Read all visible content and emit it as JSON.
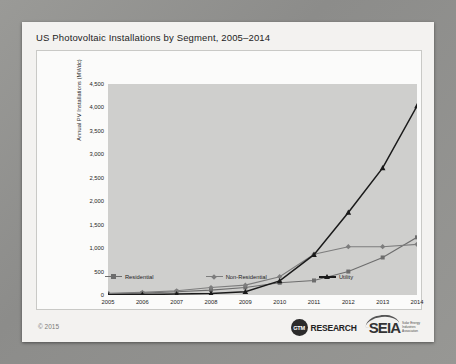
{
  "slide": {
    "title": "US Photovoltaic Installations by Segment, 2005–2014",
    "copyright": "© 2015"
  },
  "footer": {
    "gtm_mark": "GTM",
    "gtm_word": "RESEARCH",
    "seia_word": "SEIA",
    "seia_sub": "Solar Energy\nIndustries\nAssociation"
  },
  "chart_data": {
    "type": "line",
    "title": "US Photovoltaic Installations by Segment, 2005–2014",
    "xlabel": "",
    "ylabel": "Annual PV Installations (MWdc)",
    "categories": [
      "2005",
      "2006",
      "2007",
      "2008",
      "2009",
      "2010",
      "2011",
      "2012",
      "2013",
      "2014"
    ],
    "ylim": [
      0,
      4500
    ],
    "yticks": [
      0,
      500,
      1000,
      1500,
      2000,
      2500,
      3000,
      3500,
      4000,
      4500
    ],
    "ytick_labels": [
      "0",
      "500",
      "1,000",
      "1,500",
      "2,000",
      "2,500",
      "3,000",
      "3,500",
      "4,000",
      "4,500"
    ],
    "grid": false,
    "legend_position": "bottom",
    "series": [
      {
        "name": "Residential",
        "marker": "square",
        "color": "#6d6d6d",
        "values": [
          25,
          40,
          70,
          105,
          160,
          260,
          310,
          500,
          800,
          1230
        ]
      },
      {
        "name": "Non-Residential",
        "marker": "diamond",
        "color": "#7d7d7d",
        "values": [
          35,
          55,
          90,
          160,
          210,
          390,
          870,
          1030,
          1030,
          1080
        ]
      },
      {
        "name": "Utility",
        "marker": "triangle",
        "color": "#1a1a1a",
        "values": [
          5,
          10,
          20,
          30,
          70,
          300,
          860,
          1760,
          2710,
          4030
        ]
      }
    ]
  }
}
